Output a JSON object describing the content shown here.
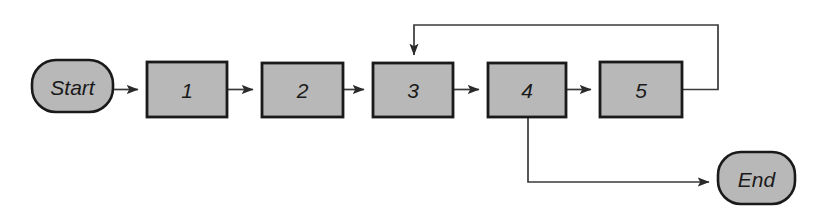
{
  "diagram": {
    "type": "flowchart",
    "orientation": "left-to-right",
    "background_color": "#ffffff",
    "node_fill_color": "#b8b8b8",
    "node_stroke_color": "#1a1a1a",
    "connector_color": "#3a3a3a",
    "nodes": [
      {
        "id": "start",
        "label": "Start",
        "shape": "rounded-terminal",
        "x": 32,
        "y": 60,
        "w": 81,
        "h": 52
      },
      {
        "id": "step1",
        "label": "1",
        "shape": "rectangle",
        "x": 147,
        "y": 62,
        "w": 80,
        "h": 55
      },
      {
        "id": "step2",
        "label": "2",
        "shape": "rectangle",
        "x": 262,
        "y": 63,
        "w": 81,
        "h": 54
      },
      {
        "id": "step3",
        "label": "3",
        "shape": "rectangle",
        "x": 373,
        "y": 63,
        "w": 80,
        "h": 54
      },
      {
        "id": "step4",
        "label": "4",
        "shape": "rectangle",
        "x": 488,
        "y": 63,
        "w": 78,
        "h": 54
      },
      {
        "id": "step5",
        "label": "5",
        "shape": "rectangle",
        "x": 600,
        "y": 62,
        "w": 82,
        "h": 55
      },
      {
        "id": "end",
        "label": "End",
        "shape": "rounded-terminal",
        "x": 718,
        "y": 152,
        "w": 77,
        "h": 52
      }
    ],
    "edges": [
      {
        "id": "start-to-1",
        "from": "start",
        "to": "step1",
        "kind": "straight-right",
        "arrowhead": true
      },
      {
        "id": "1-to-2",
        "from": "step1",
        "to": "step2",
        "kind": "straight-right",
        "arrowhead": true
      },
      {
        "id": "2-to-3",
        "from": "step2",
        "to": "step3",
        "kind": "straight-right",
        "arrowhead": true
      },
      {
        "id": "3-to-4",
        "from": "step3",
        "to": "step4",
        "kind": "straight-right",
        "arrowhead": true
      },
      {
        "id": "4-to-5",
        "from": "step4",
        "to": "step5",
        "kind": "straight-right",
        "arrowhead": true
      },
      {
        "id": "5-to-3-feedback",
        "from": "step5",
        "to": "step3",
        "kind": "loop-over-top",
        "arrowhead": true
      },
      {
        "id": "4-to-end",
        "from": "step4",
        "to": "end",
        "kind": "branch-down-right",
        "arrowhead": true
      }
    ]
  }
}
